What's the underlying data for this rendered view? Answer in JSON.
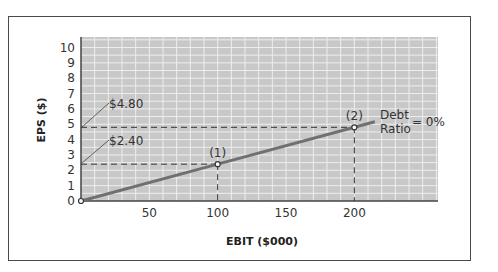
{
  "chart_data": {
    "type": "line",
    "title": "",
    "xlabel": "EBIT ($000)",
    "ylabel": "EPS ($)",
    "xlim": [
      0,
      260
    ],
    "ylim": [
      0,
      10.5
    ],
    "x_ticks": [
      "50",
      "100",
      "150",
      "200"
    ],
    "y_ticks": [
      "0",
      "1",
      "2",
      "3",
      "4",
      "5",
      "6",
      "7",
      "8",
      "9",
      "10"
    ],
    "grid": true,
    "series": [
      {
        "name": "Debt Ratio = 0%",
        "x": [
          0,
          100,
          200,
          215
        ],
        "values": [
          0,
          2.4,
          4.8,
          5.16
        ]
      }
    ],
    "points": [
      {
        "label": "(1)",
        "x": 100,
        "y": 2.4
      },
      {
        "label": "(2)",
        "x": 200,
        "y": 4.8
      }
    ],
    "annotations": [
      {
        "text": "$4.80",
        "y": 4.8
      },
      {
        "text": "$2.40",
        "y": 2.4
      },
      {
        "text_line1": "Debt",
        "text_line2": "Ratio",
        "text_suffix": "= 0%"
      }
    ]
  },
  "colors": {
    "plot_bg": "#c8c8c8",
    "grid": "#eeeeee",
    "line": "#707070",
    "dash": "#333333",
    "frame": "#4a4a4a"
  }
}
